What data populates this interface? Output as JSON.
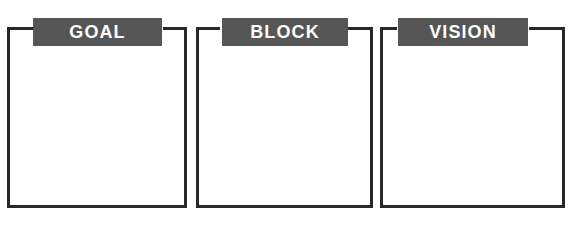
{
  "diagram": {
    "type": "bracket-boxes",
    "background_color": "#ffffff",
    "border_color": "#282828",
    "banner_color": "#565656",
    "banner_text_color": "#ffffff",
    "boxes": [
      {
        "label": "GOAL",
        "content": "",
        "left": 7,
        "width": 180,
        "banner_left": 26,
        "banner_width": 129,
        "stub_left_width": 26,
        "stub_right_width": 24
      },
      {
        "label": "BLOCK",
        "content": "",
        "left": 196,
        "width": 177,
        "banner_left": 26,
        "banner_width": 126,
        "stub_left_width": 24,
        "stub_right_width": 25
      },
      {
        "label": "VISION",
        "content": "",
        "left": 380,
        "width": 185,
        "banner_left": 18,
        "banner_width": 130,
        "stub_left_width": 17,
        "stub_right_width": 36
      }
    ]
  }
}
